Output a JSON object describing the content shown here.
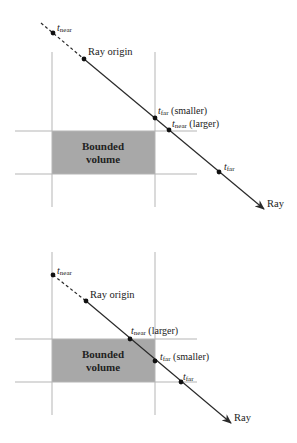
{
  "colors": {
    "grid_line": "#b5b5b5",
    "volume_fill": "#a8a8a8",
    "ray": "#2a2a2a",
    "text": "#222222"
  },
  "diagrams": [
    {
      "name": "case-miss",
      "volume_label_line1": "Bounded",
      "volume_label_line2": "volume",
      "ray_label": "Ray",
      "ray_origin_label": "Ray origin",
      "points": [
        {
          "sym": "t",
          "sub": "near",
          "suffix": ""
        },
        {
          "sym": "t",
          "sub": "far",
          "suffix": " (smaller)"
        },
        {
          "sym": "t",
          "sub": "near",
          "suffix": " (larger)"
        },
        {
          "sym": "t",
          "sub": "far",
          "suffix": ""
        }
      ]
    },
    {
      "name": "case-hit",
      "volume_label_line1": "Bounded",
      "volume_label_line2": "volume",
      "ray_label": "Ray",
      "ray_origin_label": "Ray origin",
      "points": [
        {
          "sym": "t",
          "sub": "near",
          "suffix": ""
        },
        {
          "sym": "t",
          "sub": "near",
          "suffix": " (larger)"
        },
        {
          "sym": "t",
          "sub": "far",
          "suffix": " (smaller)"
        },
        {
          "sym": "t",
          "sub": "far",
          "suffix": ""
        }
      ]
    }
  ]
}
